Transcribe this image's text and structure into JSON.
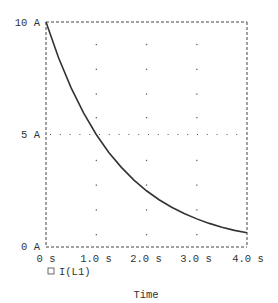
{
  "chart_data": {
    "type": "line",
    "title": "",
    "xlabel": "Time",
    "ylabel": "",
    "xlim": [
      0,
      4.0
    ],
    "ylim": [
      0,
      10
    ],
    "x_ticks": [
      "0 s",
      "1.0 s",
      "2.0 s",
      "3.0 s",
      "4.0 s"
    ],
    "y_ticks": [
      "0 A",
      "5 A",
      "10 A"
    ],
    "grid": "dotted",
    "legend": {
      "position": "bottom-left",
      "entries": [
        "I(L1)"
      ]
    },
    "series": [
      {
        "name": "I(L1)",
        "x": [
          0,
          0.25,
          0.5,
          0.75,
          1.0,
          1.25,
          1.5,
          1.75,
          2.0,
          2.25,
          2.5,
          2.75,
          3.0,
          3.25,
          3.5,
          3.75,
          4.0
        ],
        "values": [
          10.0,
          8.41,
          7.07,
          5.95,
          5.0,
          4.2,
          3.54,
          2.97,
          2.5,
          2.1,
          1.77,
          1.49,
          1.25,
          1.05,
          0.88,
          0.74,
          0.63
        ],
        "color": "#333333"
      }
    ]
  },
  "axis": {
    "x_tick_labels": [
      "0 s",
      "1.0 s",
      "2.0 s",
      "3.0 s",
      "4.0 s"
    ],
    "y_tick_labels": {
      "top": "10 A",
      "mid": "5 A",
      "bottom": "0 A"
    },
    "xlabel": "Time"
  },
  "legend": {
    "marker": "□",
    "label": "I(L1)"
  }
}
